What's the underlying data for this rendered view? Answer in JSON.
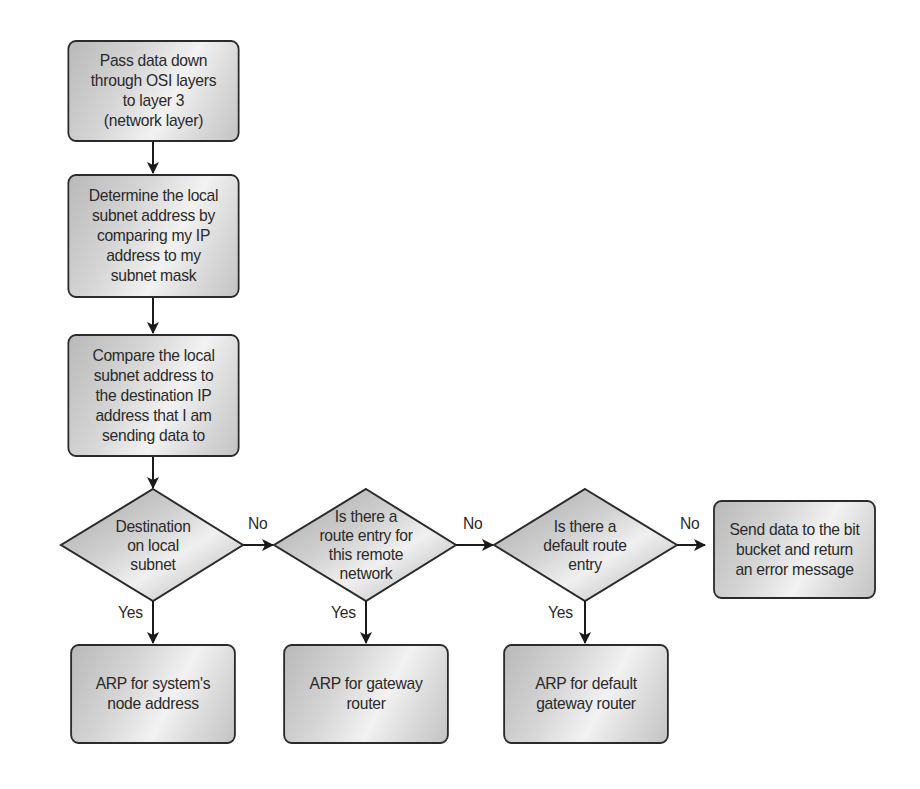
{
  "diagram": {
    "type": "flowchart",
    "nodes": {
      "step1": {
        "kind": "process",
        "label": "Pass data down\nthrough OSI layers\nto layer 3\n(network layer)"
      },
      "step2": {
        "kind": "process",
        "label": "Determine the local\nsubnet address by\ncomparing my IP\naddress to my\nsubnet mask"
      },
      "step3": {
        "kind": "process",
        "label": "Compare the local\nsubnet address to\nthe destination IP\naddress that I am\nsending data to"
      },
      "decision1": {
        "kind": "decision",
        "label": "Destination\non local\nsubnet"
      },
      "decision2": {
        "kind": "decision",
        "label": "Is there a\nroute entry for\nthis remote\nnetwork"
      },
      "decision3": {
        "kind": "decision",
        "label": "Is there a\ndefault route\nentry"
      },
      "error": {
        "kind": "process",
        "label": "Send data to the bit\nbucket and return\nan error message"
      },
      "arp_node": {
        "kind": "process",
        "label": "ARP for system's\nnode address"
      },
      "arp_gateway": {
        "kind": "process",
        "label": "ARP for gateway\nrouter"
      },
      "arp_default": {
        "kind": "process",
        "label": "ARP for default\ngateway router"
      }
    },
    "edges": {
      "e1": {
        "from": "step1",
        "to": "step2",
        "label": ""
      },
      "e2": {
        "from": "step2",
        "to": "step3",
        "label": ""
      },
      "e3": {
        "from": "step3",
        "to": "decision1",
        "label": ""
      },
      "d1_no": {
        "from": "decision1",
        "to": "decision2",
        "label": "No"
      },
      "d1_yes": {
        "from": "decision1",
        "to": "arp_node",
        "label": "Yes"
      },
      "d2_no": {
        "from": "decision2",
        "to": "decision3",
        "label": "No"
      },
      "d2_yes": {
        "from": "decision2",
        "to": "arp_gateway",
        "label": "Yes"
      },
      "d3_no": {
        "from": "decision3",
        "to": "error",
        "label": "No"
      },
      "d3_yes": {
        "from": "decision3",
        "to": "arp_default",
        "label": "Yes"
      }
    },
    "colors": {
      "stroke": "#2b2b2b",
      "fill_dark": "#b9b9b9",
      "fill_light": "#f2f2f2",
      "text": "#2a2a2a",
      "background": "#ffffff"
    }
  }
}
